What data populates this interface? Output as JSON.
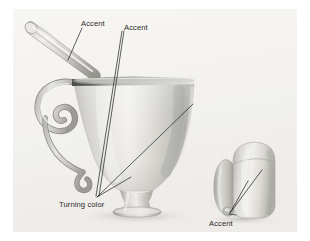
{
  "figure": {
    "background_color": "#ffffff",
    "plate_color": "#f2f1ee",
    "ink_color": "#2b2b2b",
    "ceramic_light": "#f4f3f0",
    "ceramic_mid": "#cfcec9",
    "ceramic_dark": "#9a9994",
    "ceramic_shadow": "#6f6e6a"
  },
  "labels": {
    "accent_spoon": "Accent",
    "accent_rim": "Accent",
    "turning_color": "Turning color",
    "accent_vessel": "Accent"
  },
  "objects": {
    "spoon": "decorative spoon with tapered handle",
    "mug": "footed mug with ornate scroll handle",
    "vessel": "small rounded vessel at right"
  }
}
